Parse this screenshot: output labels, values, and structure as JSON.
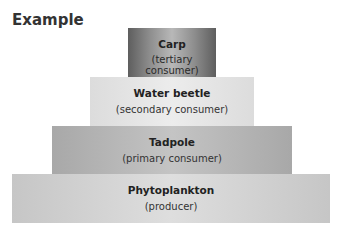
{
  "heading": "Example",
  "pyramid": {
    "levels": [
      {
        "name": "Carp",
        "role": "(tertiary consumer)"
      },
      {
        "name": "Water beetle",
        "role": "(secondary consumer)"
      },
      {
        "name": "Tadpole",
        "role": "(primary consumer)"
      },
      {
        "name": "Phytoplankton",
        "role": "(producer)"
      }
    ]
  }
}
